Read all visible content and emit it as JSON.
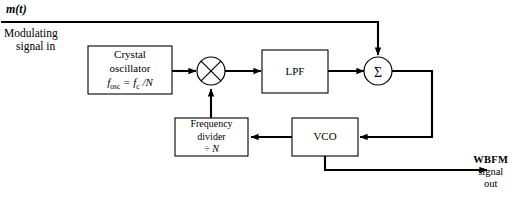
{
  "diagram": {
    "title_label": "m(t)",
    "input_label_line1": "Modulating",
    "input_label_line2": "signal in",
    "output_label_line1": "WBFM",
    "output_label_line2": "signal",
    "output_label_line3": "out",
    "blocks": {
      "crystal_oscillator": {
        "line1": "Crystal",
        "line2": "oscillator",
        "formula_f": "f",
        "formula_sub1": "osc",
        "formula_eq": " = ",
        "formula_fc": "f",
        "formula_sub2": "c",
        "formula_div": " /N"
      },
      "lpf": {
        "label": "LPF"
      },
      "vco": {
        "label": "VCO"
      },
      "frequency_divider": {
        "line1": "Frequency",
        "line2": "divider",
        "line3_symbol": "÷ ",
        "line3_n": "N"
      },
      "summer": {
        "symbol": "Σ"
      },
      "mixer": {
        "symbol": "×"
      }
    },
    "colors": {
      "stroke": "#000000",
      "background": "#ffffff",
      "text": "#000000"
    }
  }
}
